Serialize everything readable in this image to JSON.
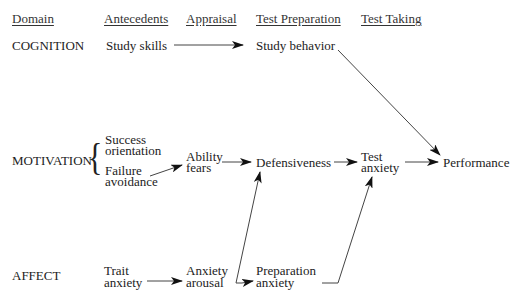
{
  "headers": {
    "domain": "Domain",
    "antecedents": "Antecedents",
    "appraisal": "Appraisal",
    "test_preparation": "Test Preparation",
    "test_taking": "Test Taking"
  },
  "domains": {
    "cognition": "COGNITION",
    "motivation": "MOTIVATION",
    "affect": "AFFECT"
  },
  "nodes": {
    "study_skills": "Study skills",
    "study_behavior": "Study behavior",
    "success_1": "Success",
    "success_2": "orientation",
    "failure_1": "Failure",
    "failure_2": "avoidance",
    "ability_1": "Ability",
    "ability_2": "fears",
    "defensiveness": "Defensiveness",
    "test_anxiety_1": "Test",
    "test_anxiety_2": "anxiety",
    "performance": "Performance",
    "trait_1": "Trait",
    "trait_2": "anxiety",
    "arousal_1": "Anxiety",
    "arousal_2": "arousal",
    "prep_1": "Preparation",
    "prep_2": "anxiety"
  },
  "edges": [
    {
      "from": "Study skills",
      "to": "Study behavior"
    },
    {
      "from": "Study behavior",
      "to": "Performance"
    },
    {
      "from": "Failure avoidance",
      "to": "Ability fears"
    },
    {
      "from": "Ability fears",
      "to": "Defensiveness"
    },
    {
      "from": "Defensiveness",
      "to": "Test anxiety"
    },
    {
      "from": "Test anxiety",
      "to": "Performance"
    },
    {
      "from": "Trait anxiety",
      "to": "Anxiety arousal"
    },
    {
      "from": "Anxiety arousal",
      "to": "Defensiveness"
    },
    {
      "from": "Anxiety arousal",
      "to": "Preparation anxiety"
    },
    {
      "from": "Preparation anxiety",
      "to": "Test anxiety"
    }
  ]
}
